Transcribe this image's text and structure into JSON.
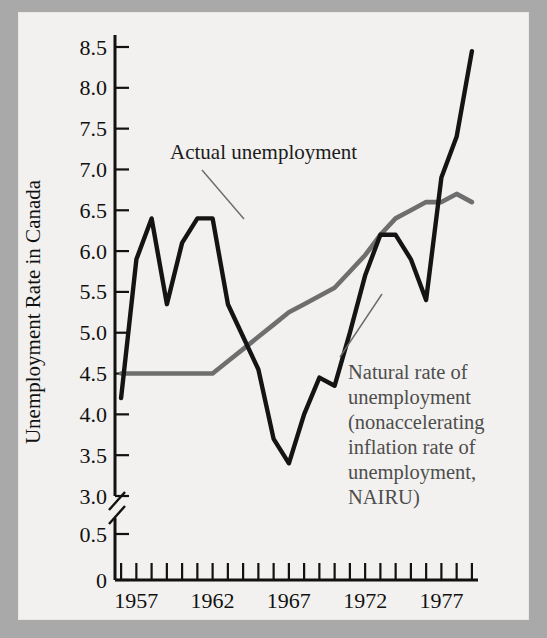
{
  "figure": {
    "background_color": "#f2f1ef",
    "border_color": "#a9a9a9"
  },
  "chart_data": {
    "type": "line",
    "title": "",
    "xlabel": "",
    "ylabel": "Unemployment Rate in Canada",
    "xlim": [
      1955.6,
      1979.4
    ],
    "ylim": [
      3.0,
      8.5
    ],
    "y_axis_break": {
      "present": true,
      "below_break_ticks": [
        0,
        0.5
      ],
      "break_between": [
        0.5,
        3.0
      ]
    },
    "grid": false,
    "legend_position": "inline-annotations",
    "y_tick_labels": [
      "0",
      "0.5",
      "3.0",
      "3.5",
      "4.0",
      "4.5",
      "5.0",
      "5.5",
      "6.0",
      "6.5",
      "7.0",
      "7.5",
      "8.0",
      "8.5"
    ],
    "y_tick_values": [
      0,
      0.5,
      3.0,
      3.5,
      4.0,
      4.5,
      5.0,
      5.5,
      6.0,
      6.5,
      7.0,
      7.5,
      8.0,
      8.5
    ],
    "x_tick_labels": [
      "1957",
      "1962",
      "1967",
      "1972",
      "1977"
    ],
    "x_tick_values": [
      1957,
      1962,
      1967,
      1972,
      1977
    ],
    "x_minor_tick_values": [
      1956,
      1957,
      1958,
      1959,
      1960,
      1961,
      1962,
      1963,
      1964,
      1965,
      1966,
      1967,
      1968,
      1969,
      1970,
      1971,
      1972,
      1973,
      1974,
      1975,
      1976,
      1977,
      1978,
      1979
    ],
    "x": [
      1956,
      1957,
      1958,
      1959,
      1960,
      1961,
      1962,
      1963,
      1964,
      1965,
      1966,
      1967,
      1968,
      1969,
      1970,
      1971,
      1972,
      1973,
      1974,
      1975,
      1976,
      1977,
      1978,
      1979
    ],
    "series": [
      {
        "name": "Actual unemployment",
        "color": "#141414",
        "values": [
          4.2,
          5.9,
          6.4,
          5.35,
          6.1,
          6.4,
          6.4,
          5.35,
          4.95,
          4.55,
          3.7,
          3.4,
          4.0,
          4.45,
          4.35,
          5.0,
          5.7,
          6.2,
          6.2,
          5.9,
          5.4,
          6.9,
          7.4,
          8.45
        ]
      },
      {
        "name": "Natural rate of unemployment (nonaccelerating inflation rate of unemployment, NAIRU)",
        "color": "#6e6e6e",
        "values": [
          4.5,
          4.5,
          4.5,
          4.5,
          4.5,
          4.5,
          4.5,
          4.65,
          4.8,
          4.95,
          5.1,
          5.25,
          5.35,
          5.45,
          5.55,
          5.75,
          5.95,
          6.2,
          6.4,
          6.5,
          6.6,
          6.6,
          6.7,
          6.6
        ]
      }
    ],
    "annotations": [
      {
        "name": "actual-unemployment-label",
        "text": "Actual unemployment",
        "lines": [
          "Actual unemployment"
        ],
        "points_to_year": 1961,
        "points_to_value": 6.4
      },
      {
        "name": "nairu-label",
        "text": "Natural rate of unemployment (nonaccelerating inflation rate of unemployment, NAIRU)",
        "lines": [
          "Natural  rate of",
          "unemployment",
          "(nonaccelerating",
          "inflation rate of",
          "unemployment,",
          "NAIRU)"
        ],
        "points_to_year": 1970,
        "points_to_value": 5.5
      }
    ]
  }
}
